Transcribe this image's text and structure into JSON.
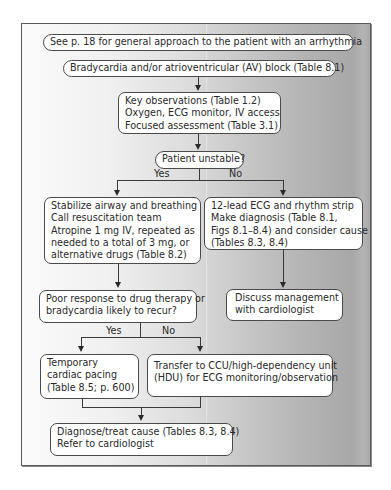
{
  "flowchart": {
    "nodes": {
      "start": {
        "text": "See p. 18 for general approach to the patient with an arrhythmia"
      },
      "brady": {
        "text": "Bradycardia and/or atrioventricular (AV) block (Table 8.1)"
      },
      "key_obs": {
        "lines": [
          "Key observations (Table 1.2)",
          "Oxygen, ECG monitor, IV access",
          "Focused assessment (Table 3.1)"
        ]
      },
      "unstable": {
        "text": "Patient unstable?"
      },
      "stabilize": {
        "lines": [
          "Stabilize airway and breathing",
          "Call resuscitation team",
          "Atropine 1 mg IV, repeated as",
          "needed to a total of 3 mg, or",
          "alternative drugs (Table 8.2)"
        ]
      },
      "ecg": {
        "lines": [
          "12-lead ECG and rhythm strip",
          "Make diagnosis (Table 8.1,",
          "Figs 8.1–8.4) and consider cause",
          "(Tables 8.3, 8.4)"
        ]
      },
      "poor_response": {
        "lines": [
          "Poor response to drug therapy or",
          "bradycardia likely to recur?"
        ]
      },
      "discuss": {
        "lines": [
          "Discuss management",
          "with cardiologist"
        ]
      },
      "pacing": {
        "lines": [
          "Temporary",
          "cardiac pacing",
          "(Table 8.5; p. 600)"
        ]
      },
      "transfer": {
        "lines": [
          "Transfer to CCU/high-dependency unit",
          "(HDU) for ECG monitoring/observation"
        ]
      },
      "diagnose": {
        "lines": [
          "Diagnose/treat cause (Tables 8.3, 8.4)",
          "Refer to cardiologist"
        ]
      }
    },
    "branch_labels": {
      "unstable_yes": "Yes",
      "unstable_no": "No",
      "poor_yes": "Yes",
      "poor_no": "No"
    },
    "edges": [
      [
        "brady",
        "key_obs"
      ],
      [
        "key_obs",
        "unstable"
      ],
      [
        "unstable",
        "stabilize",
        "Yes"
      ],
      [
        "unstable",
        "ecg",
        "No"
      ],
      [
        "stabilize",
        "poor_response"
      ],
      [
        "ecg",
        "discuss"
      ],
      [
        "poor_response",
        "pacing",
        "Yes"
      ],
      [
        "poor_response",
        "transfer",
        "No"
      ],
      [
        "pacing",
        "diagnose"
      ],
      [
        "transfer",
        "diagnose"
      ]
    ],
    "colors": {
      "box_fill": "#ffffff",
      "box_border": "#4a4a4a",
      "line": "#3a3a3a",
      "background_left": "#fbfbfb",
      "background_right": "#a8a8a8"
    }
  }
}
